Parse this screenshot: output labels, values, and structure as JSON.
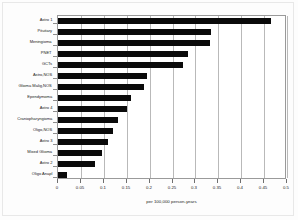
{
  "chart_data": {
    "type": "bar",
    "orientation": "horizontal",
    "title": "",
    "subtitle": "",
    "xlabel": "per 100,000 person-years",
    "ylabel": "",
    "xlim": [
      0,
      0.5
    ],
    "ylim": null,
    "grid": true,
    "legend": null,
    "legend_position": "none",
    "bar_color": "#0a0a0a",
    "xticks": [
      "0",
      "0.05",
      "0.1",
      "0.15",
      "0.2",
      "0.25",
      "0.3",
      "0.35",
      "0.4",
      "0.45",
      "0.5"
    ],
    "xtick_values": [
      0,
      0.05,
      0.1,
      0.15,
      0.2,
      0.25,
      0.3,
      0.35,
      0.4,
      0.45,
      0.5
    ],
    "categories": [
      "Astro 1",
      "Pituitary",
      "Meningioma",
      "PNET",
      "GCTs",
      "Astro,NOS",
      "Glioma Malig,NOS",
      "Ependymoma",
      "Astro 4",
      "Craniopharyngioma",
      "Oligo,NOS",
      "Astro 3",
      "Mixed Glioma",
      "Astro 2",
      "Oligo Anapl"
    ],
    "values": [
      0.465,
      0.333,
      0.332,
      0.283,
      0.272,
      0.195,
      0.188,
      0.16,
      0.15,
      0.13,
      0.12,
      0.11,
      0.095,
      0.08,
      0.02
    ]
  },
  "colors": {
    "bar": "#0a0a0a",
    "grid": "#b9b9b9",
    "axis": "#9a9a9a",
    "text": "#1a1a1a",
    "background": "#ffffff"
  }
}
